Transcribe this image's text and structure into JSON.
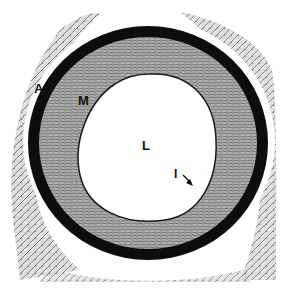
{
  "figure": {
    "labels": [
      {
        "id": "A",
        "text": "A",
        "meaning": "tunica adventitia"
      },
      {
        "id": "M",
        "text": "M",
        "meaning": "tunica media"
      },
      {
        "id": "L",
        "text": "L",
        "meaning": "lumen"
      },
      {
        "id": "I",
        "text": "I",
        "meaning": "tunica intima (arrow)"
      }
    ],
    "colors": {
      "background": "#ffffff",
      "outer_ring": "#0d0d0d",
      "media": "#9a9a9a",
      "adventitia": "#b5b5b5",
      "lumen": "#ffffff"
    }
  }
}
